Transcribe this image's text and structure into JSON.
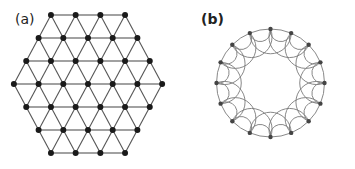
{
  "panels": {
    "a": {
      "label": "(a)",
      "title": "Hexagonal triangular lattice",
      "rows": [
        4,
        5,
        6,
        7,
        6,
        5,
        4
      ],
      "row_y": [
        15,
        38,
        61,
        84,
        107,
        130,
        153
      ],
      "center_x": 88,
      "spacing": 24.7,
      "node_color": "#1a1a1a",
      "edge_color": "#555555"
    },
    "b": {
      "label": "(b)",
      "title": "Ring lattice with nearest and next-nearest neighbor arcs",
      "node_count": 16,
      "center": [
        93.5,
        83
      ],
      "radius": 54,
      "node_color": "#444444",
      "edge_color": "#7a7a7a"
    }
  }
}
